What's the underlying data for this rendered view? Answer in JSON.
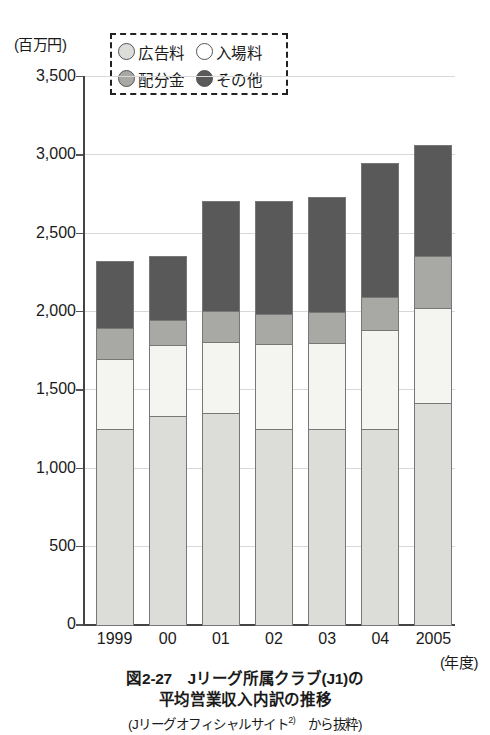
{
  "chart_data": {
    "type": "bar",
    "subtype": "stacked-bar",
    "xlabel": "(年度)",
    "ylabel": "(百万円)",
    "ylim": [
      0,
      3500
    ],
    "ytick_step": 500,
    "ytick_labels": [
      "3,500",
      "3,000",
      "2,500",
      "2,000",
      "1,500",
      "1,000",
      "500",
      "0"
    ],
    "ytick_values": [
      3500,
      3000,
      2500,
      2000,
      1500,
      1000,
      500,
      0
    ],
    "grid": true,
    "legend_position": "top-center",
    "categories": [
      "1999",
      "00",
      "01",
      "02",
      "03",
      "04",
      "2005"
    ],
    "series": [
      {
        "name": "広告料",
        "color": "#dcdcd8",
        "values": [
          1255,
          1340,
          1355,
          1255,
          1255,
          1255,
          1420
        ]
      },
      {
        "name": "入場料",
        "color": "#f4f4f1",
        "values": [
          455,
          460,
          460,
          550,
          555,
          635,
          615
        ]
      },
      {
        "name": "配分金",
        "color": "#a8a8a5",
        "values": [
          200,
          165,
          205,
          200,
          205,
          220,
          335
        ]
      },
      {
        "name": "その他",
        "color": "#595959",
        "values": [
          440,
          415,
          710,
          725,
          740,
          865,
          720
        ]
      }
    ],
    "totals": [
      2350,
      2380,
      2730,
      2730,
      2755,
      2975,
      3090
    ],
    "annotations": []
  },
  "legend": {
    "items": [
      {
        "label": "広告料",
        "swatch": "circle-light-gray"
      },
      {
        "label": "入場料",
        "swatch": "circle-white"
      },
      {
        "label": "配分金",
        "swatch": "circle-medium-gray"
      },
      {
        "label": "その他",
        "swatch": "circle-dark-gray"
      }
    ]
  },
  "caption": {
    "line1": "図2-27　Jリーグ所属クラブ(J1)の",
    "line2": "平均営業収入内訳の推移",
    "line3_prefix": "(Jリーグオフィシャルサイト",
    "line3_sup": "2)",
    "line3_suffix": "　から抜粋)"
  }
}
